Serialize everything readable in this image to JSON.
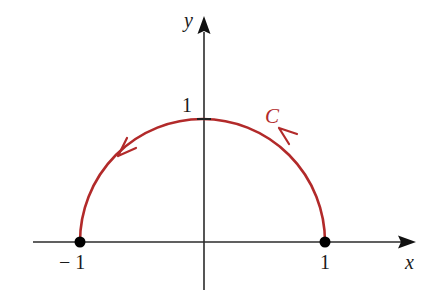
{
  "diagram": {
    "type": "contour-semicircle",
    "axes": {
      "x_label": "x",
      "y_label": "y"
    },
    "tick_labels": {
      "neg_one": "− 1",
      "pos_one_x": "1",
      "pos_one_y": "1"
    },
    "curve": {
      "label": "C",
      "description": "Upper half of unit circle traversed counterclockwise from (1,0) to (-1,0)",
      "color": "#B22A2A"
    },
    "points": [
      {
        "name": "(-1, 0)",
        "x": -1,
        "y": 0
      },
      {
        "name": "(1, 0)",
        "x": 1,
        "y": 0
      }
    ],
    "colors": {
      "axis": "#2b2b2b",
      "curve": "#B22A2A",
      "points": "#000000"
    }
  }
}
